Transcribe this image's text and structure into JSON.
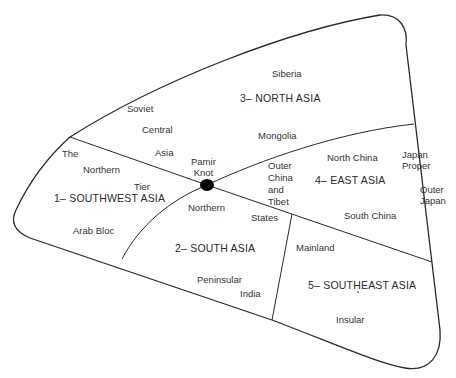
{
  "diagram": {
    "type": "schematic-region-diagram",
    "colors": {
      "line": "#2a2a2a",
      "text": "#333333",
      "background": "#ffffff",
      "node": "#000000"
    },
    "center_node": {
      "label_line1": "Pamir",
      "label_line2": "Knot"
    },
    "regions": [
      {
        "id": "southwest",
        "title": "1– SOUTHWEST ASIA",
        "sublabels": [
          "The",
          "Northern",
          "Tier",
          "Arab Bloc"
        ]
      },
      {
        "id": "south",
        "title": "2– SOUTH ASIA",
        "sublabels": [
          "Northern",
          "States",
          "Peninsular",
          "India"
        ]
      },
      {
        "id": "north",
        "title": "3– NORTH ASIA",
        "sublabels": [
          "Siberia",
          "Soviet",
          "Central",
          "Asia",
          "Mongolia"
        ]
      },
      {
        "id": "east",
        "title": "4– EAST ASIA",
        "sublabels": [
          "North China",
          "Outer",
          "China",
          "and",
          "Tibet",
          "South China",
          "Japan",
          "Proper",
          "Outer",
          "Japan"
        ]
      },
      {
        "id": "southeast",
        "title": "5– SOUTHEAST ASIA",
        "sublabels": [
          "Mainland",
          "Insular"
        ]
      }
    ]
  }
}
